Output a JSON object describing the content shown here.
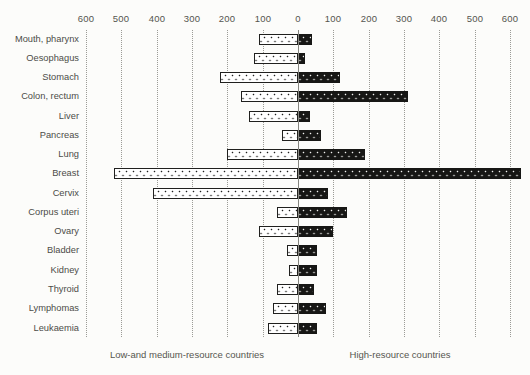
{
  "chart_data": {
    "type": "bar",
    "variant": "diverging-horizontal",
    "title": "",
    "categories": [
      "Mouth, pharynx",
      "Oesophagus",
      "Stomach",
      "Colon, rectum",
      "Liver",
      "Pancreas",
      "Lung",
      "Breast",
      "Cervix",
      "Corpus uteri",
      "Ovary",
      "Bladder",
      "Kidney",
      "Thyroid",
      "Lymphomas",
      "Leukaemia"
    ],
    "series": [
      {
        "name": "Low-and medium-resource countries",
        "side": "left",
        "values": [
          110,
          125,
          220,
          160,
          140,
          45,
          200,
          520,
          410,
          60,
          110,
          30,
          25,
          60,
          70,
          85
        ]
      },
      {
        "name": "High-resource countries",
        "side": "right",
        "values": [
          40,
          20,
          120,
          310,
          35,
          65,
          190,
          630,
          85,
          140,
          100,
          55,
          55,
          45,
          80,
          55
        ]
      }
    ],
    "axis": {
      "tick_labels": [
        "600",
        "500",
        "400",
        "300",
        "200",
        "100",
        "0",
        "100",
        "200",
        "300",
        "400",
        "500",
        "600"
      ],
      "side_max": 600,
      "gridlines": "dotted-vertical",
      "zero_axis": "solid"
    },
    "colors": {
      "left_bar_fill": "#ffffff",
      "left_bar_dots": "#20201e",
      "right_bar_fill": "#171715",
      "right_bar_dots": "#f4f4f2",
      "grid": "#9b9b96",
      "zero_axis": "#85857f",
      "text": "#4c4c48",
      "background": "#fcfcfa"
    },
    "legend_position": "bottom"
  }
}
